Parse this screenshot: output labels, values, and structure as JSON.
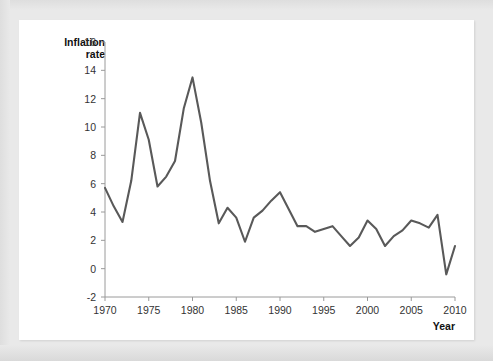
{
  "chart_data": {
    "type": "line",
    "title": "",
    "subtitle": "",
    "xlabel": "Year",
    "ylabel": "Inflation rate",
    "ylabel_lines": [
      "Inflation",
      "rate"
    ],
    "xlim": [
      1970,
      2010
    ],
    "ylim": [
      -2,
      16
    ],
    "xticks": [
      1970,
      1975,
      1980,
      1985,
      1990,
      1995,
      2000,
      2005,
      2010
    ],
    "yticks": [
      -2,
      0,
      2,
      4,
      6,
      8,
      10,
      12,
      14,
      16
    ],
    "xtick_labels": [
      "1970",
      "1975",
      "1980",
      "1985",
      "1990",
      "1995",
      "2000",
      "2005",
      "2010"
    ],
    "ytick_labels": [
      "-2",
      "0",
      "2",
      "4",
      "6",
      "8",
      "10",
      "12",
      "14",
      "16"
    ],
    "grid": false,
    "legend": false,
    "legend_position": "none",
    "line_color": "#595959",
    "axis_color": "#9a9a9a",
    "background_color": "#ffffff",
    "page_background_color": "#e9e9e9",
    "x": [
      1970,
      1971,
      1972,
      1973,
      1974,
      1975,
      1976,
      1977,
      1978,
      1979,
      1980,
      1981,
      1982,
      1983,
      1984,
      1985,
      1986,
      1987,
      1988,
      1989,
      1990,
      1991,
      1992,
      1993,
      1994,
      1995,
      1996,
      1997,
      1998,
      1999,
      2000,
      2001,
      2002,
      2003,
      2004,
      2005,
      2006,
      2007,
      2008,
      2009,
      2010
    ],
    "values": [
      5.7,
      4.4,
      3.3,
      6.2,
      11.0,
      9.1,
      5.8,
      6.5,
      7.6,
      11.3,
      13.5,
      10.3,
      6.2,
      3.2,
      4.3,
      3.6,
      1.9,
      3.6,
      4.1,
      4.8,
      5.4,
      4.2,
      3.0,
      3.0,
      2.6,
      2.8,
      3.0,
      2.3,
      1.6,
      2.2,
      3.4,
      2.8,
      1.6,
      2.3,
      2.7,
      3.4,
      3.2,
      2.9,
      3.8,
      -0.4,
      1.6
    ],
    "series_name": "Inflation rate"
  },
  "annotations": {
    "y_axis_label_top": "Inflation",
    "y_axis_label_bottom": "rate",
    "x_axis_label": "Year"
  }
}
